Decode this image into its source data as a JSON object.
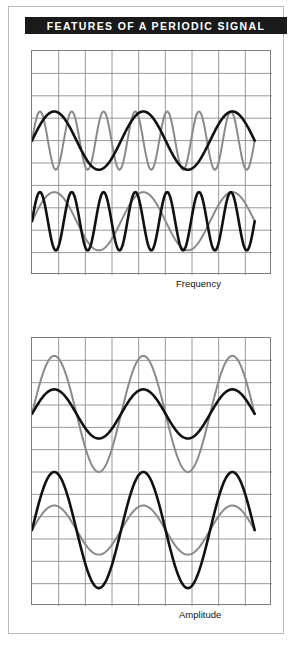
{
  "figure": {
    "title": "FEATURES OF A PERIODIC SIGNAL",
    "title_bg": "#1a1a1a",
    "title_color": "#ffffff",
    "frame_color": "#b9b9b9",
    "background": "#ffffff"
  },
  "colors": {
    "grid": "#8c8c8c",
    "plot_border": "#7d7d7d",
    "wave_dark": "#111111",
    "wave_light": "#8a8a8a"
  },
  "panels": [
    {
      "id": "frequency",
      "label": "Frequency"
    },
    {
      "id": "amplitude",
      "label": "Amplitude"
    }
  ],
  "chart_data": [
    {
      "type": "line",
      "title": "Frequency",
      "xlabel": "",
      "ylabel": "",
      "grid": true,
      "grid_cols": 9,
      "grid_rows": 10,
      "xlim": [
        0,
        9
      ],
      "ylim": [
        0,
        10
      ],
      "legend": "none",
      "annotations": [
        "Frequency"
      ],
      "series": [
        {
          "name": "low-frequency-dark",
          "style": "sine",
          "color": "#111111",
          "stroke": 2.6,
          "cycles": 2.5,
          "amplitude": 1.3,
          "baseline_y": 4.0,
          "phase": 0,
          "group": "upper-pair"
        },
        {
          "name": "high-frequency-light",
          "style": "sine",
          "color": "#8a8a8a",
          "stroke": 2.0,
          "cycles": 7,
          "amplitude": 1.3,
          "baseline_y": 4.0,
          "phase": 0,
          "group": "upper-pair"
        },
        {
          "name": "low-frequency-light",
          "style": "sine",
          "color": "#8a8a8a",
          "stroke": 2.0,
          "cycles": 2.5,
          "amplitude": 1.3,
          "baseline_y": 7.6,
          "phase": 0,
          "group": "lower-pair"
        },
        {
          "name": "high-frequency-dark",
          "style": "sine",
          "color": "#111111",
          "stroke": 2.6,
          "cycles": 7,
          "amplitude": 1.3,
          "baseline_y": 7.6,
          "phase": 0,
          "group": "lower-pair"
        }
      ]
    },
    {
      "type": "line",
      "title": "Amplitude",
      "xlabel": "",
      "ylabel": "",
      "grid": true,
      "grid_cols": 9,
      "grid_rows": 12,
      "xlim": [
        0,
        9
      ],
      "ylim": [
        0,
        12
      ],
      "legend": "none",
      "annotations": [
        "Amplitude"
      ],
      "series": [
        {
          "name": "large-amplitude-light",
          "style": "sine",
          "color": "#8a8a8a",
          "stroke": 2.0,
          "cycles": 2.5,
          "amplitude": 2.6,
          "baseline_y": 3.4,
          "phase": 0,
          "group": "upper-pair"
        },
        {
          "name": "small-amplitude-dark",
          "style": "sine",
          "color": "#111111",
          "stroke": 2.6,
          "cycles": 2.5,
          "amplitude": 1.1,
          "baseline_y": 3.4,
          "phase": 0,
          "group": "upper-pair"
        },
        {
          "name": "large-amplitude-dark",
          "style": "sine",
          "color": "#111111",
          "stroke": 2.6,
          "cycles": 2.5,
          "amplitude": 2.6,
          "baseline_y": 8.6,
          "phase": 0,
          "group": "lower-pair"
        },
        {
          "name": "small-amplitude-light",
          "style": "sine",
          "color": "#8a8a8a",
          "stroke": 2.0,
          "cycles": 2.5,
          "amplitude": 1.1,
          "baseline_y": 8.6,
          "phase": 0,
          "group": "lower-pair"
        }
      ]
    }
  ]
}
